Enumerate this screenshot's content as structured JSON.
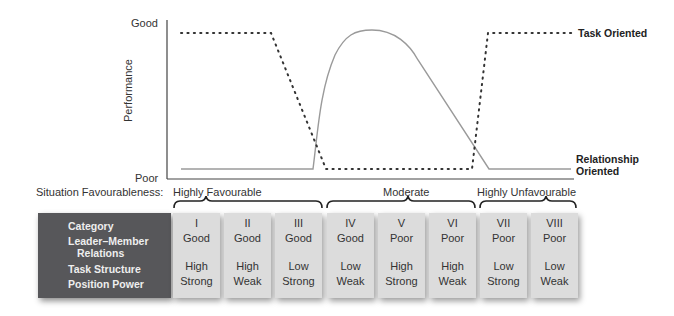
{
  "chart": {
    "y_axis_title": "Performance",
    "y_top_label": "Good",
    "y_bottom_label": "Poor",
    "legend": {
      "task_oriented": "Task Oriented",
      "relationship_oriented": "Relationship Oriented"
    }
  },
  "situation": {
    "label": "Situation Favourableness:",
    "groups": [
      {
        "label": "Highly Favourable",
        "categories": [
          "I",
          "II",
          "III"
        ]
      },
      {
        "label": "Moderate",
        "categories": [
          "IV",
          "V",
          "VI"
        ]
      },
      {
        "label": "Highly Unfavourable",
        "categories": [
          "VII",
          "VIII"
        ]
      }
    ]
  },
  "table": {
    "header": {
      "category": "Category",
      "lmr_line1": "Leader–Member",
      "lmr_line2": "Relations",
      "task_structure": "Task Structure",
      "position_power": "Position Power"
    },
    "categories": [
      {
        "id": "I",
        "lmr": "Good",
        "task": "High",
        "power": "Strong"
      },
      {
        "id": "II",
        "lmr": "Good",
        "task": "High",
        "power": "Weak"
      },
      {
        "id": "III",
        "lmr": "Good",
        "task": "Low",
        "power": "Strong"
      },
      {
        "id": "IV",
        "lmr": "Good",
        "task": "Low",
        "power": "Weak"
      },
      {
        "id": "V",
        "lmr": "Poor",
        "task": "High",
        "power": "Strong"
      },
      {
        "id": "VI",
        "lmr": "Poor",
        "task": "High",
        "power": "Weak"
      },
      {
        "id": "VII",
        "lmr": "Poor",
        "task": "Low",
        "power": "Strong"
      },
      {
        "id": "VIII",
        "lmr": "Poor",
        "task": "Low",
        "power": "Weak"
      }
    ]
  },
  "colors": {
    "header_bg": "#57575a",
    "cell_bg": "#dcdcdc",
    "task_line": "#333333",
    "relationship_line": "#9a9a9a"
  }
}
